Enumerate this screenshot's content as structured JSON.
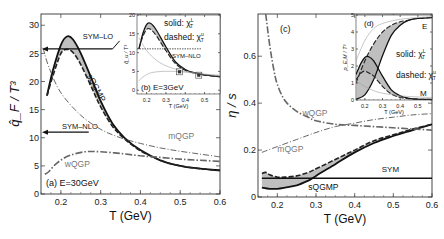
{
  "chart_data": [
    {
      "panel": "a",
      "type": "line",
      "label": "(a) E=30GeV",
      "xlabel": "T (GeV)",
      "ylabel": "q̂_F / T³",
      "xlim": [
        0.15,
        0.6
      ],
      "ylim": [
        0,
        32
      ],
      "xticks": [
        0.2,
        0.3,
        0.4,
        0.5,
        0.6
      ],
      "yticks": [
        0,
        5,
        10,
        15,
        20,
        25,
        30
      ],
      "annotations": [
        {
          "text": "SYM–LO",
          "value": 25.8,
          "arrow": "left"
        },
        {
          "text": "SYM–NLO",
          "value": 11.0,
          "arrow": "left"
        }
      ],
      "series": [
        {
          "name": "sQGMP (solid χ_T^L)",
          "style": "solid",
          "x": [
            0.165,
            0.18,
            0.2,
            0.215,
            0.23,
            0.25,
            0.28,
            0.3,
            0.33,
            0.36,
            0.4,
            0.45,
            0.5,
            0.55,
            0.6
          ],
          "y": [
            17.5,
            22,
            26.5,
            28,
            27.5,
            25,
            20,
            16.5,
            12.5,
            10,
            7.8,
            6.0,
            5.0,
            4.5,
            4.2
          ]
        },
        {
          "name": "sQGMP (dashed χ_T^u)",
          "style": "dashed",
          "x": [
            0.165,
            0.18,
            0.2,
            0.215,
            0.23,
            0.25,
            0.28,
            0.3,
            0.33,
            0.36,
            0.4,
            0.45,
            0.5,
            0.55,
            0.6
          ],
          "y": [
            17.5,
            21,
            25,
            25.7,
            25.2,
            23,
            18.5,
            15.5,
            12,
            9.8,
            7.7,
            6.0,
            5.0,
            4.5,
            4.2
          ]
        },
        {
          "name": "mQGP",
          "style": "dashdot-thin",
          "x": [
            0.155,
            0.17,
            0.2,
            0.25,
            0.3,
            0.35,
            0.4,
            0.45,
            0.5,
            0.55,
            0.6
          ],
          "y": [
            26,
            22.5,
            18,
            14,
            11.5,
            10,
            9,
            8.2,
            7.6,
            7.1,
            6.6
          ]
        },
        {
          "name": "wQGP",
          "style": "dashdot-thick",
          "x": [
            0.16,
            0.17,
            0.19,
            0.22,
            0.26,
            0.3,
            0.35,
            0.4,
            0.45,
            0.5,
            0.55,
            0.6
          ],
          "y": [
            3.5,
            4,
            5.5,
            6.8,
            7.5,
            7.5,
            7.2,
            6.8,
            6.5,
            6.2,
            6.0,
            5.8
          ]
        }
      ],
      "series_labels": [
        "sQGMP",
        "mQGP",
        "wQGP"
      ]
    },
    {
      "panel": "b",
      "type": "line",
      "label": "(b) E=3GeV",
      "inset_of": "a",
      "xlabel": "T (GeV)",
      "ylabel": "q̂_u / T³",
      "xlim": [
        0.15,
        0.58
      ],
      "ylim": [
        -1,
        20
      ],
      "xticks": [
        0.2,
        0.3,
        0.4,
        0.5
      ],
      "yticks": [
        0,
        5,
        10,
        15,
        20
      ],
      "legend": [
        "solid: χ_T^L",
        "dashed: χ_T^u"
      ],
      "annotations": [
        {
          "text": "SYM–NLO",
          "value": 11.0,
          "style": "dotted"
        }
      ],
      "series": [
        {
          "name": "solid",
          "style": "solid",
          "x": [
            0.16,
            0.18,
            0.2,
            0.22,
            0.25,
            0.3,
            0.35,
            0.4,
            0.45,
            0.5,
            0.58
          ],
          "y": [
            11,
            15,
            17.5,
            17.8,
            16,
            11.5,
            7.5,
            5.5,
            4.6,
            4.1,
            3.6
          ]
        },
        {
          "name": "dashed",
          "style": "dashed",
          "x": [
            0.16,
            0.18,
            0.2,
            0.22,
            0.25,
            0.3,
            0.35,
            0.4,
            0.45,
            0.5,
            0.58
          ],
          "y": [
            11,
            14.2,
            16.2,
            16.2,
            14.5,
            10.5,
            7.0,
            5.3,
            4.5,
            4.0,
            3.6
          ]
        },
        {
          "name": "mQGP",
          "style": "thin-gray",
          "x": [
            0.16,
            0.2,
            0.25,
            0.3,
            0.35,
            0.4,
            0.5,
            0.58
          ],
          "y": [
            14,
            10.5,
            8,
            6.5,
            5.6,
            5,
            4.3,
            4
          ]
        },
        {
          "name": "wQGP",
          "style": "thin-gray",
          "x": [
            0.16,
            0.18,
            0.22,
            0.28,
            0.35,
            0.4,
            0.5,
            0.58
          ],
          "y": [
            2.5,
            3.5,
            4.6,
            5.0,
            5.0,
            4.8,
            4.2,
            3.8
          ]
        }
      ],
      "data_points": [
        {
          "x": 0.37,
          "y": 4.9
        },
        {
          "x": 0.47,
          "y": 4.0
        }
      ]
    },
    {
      "panel": "c",
      "type": "line",
      "label": "(c)",
      "xlabel": "T (GeV)",
      "ylabel": "η / s",
      "xlim": [
        0.15,
        0.6
      ],
      "ylim": [
        0,
        0.78
      ],
      "xticks": [
        0.2,
        0.3,
        0.4,
        0.5,
        0.6
      ],
      "yticks": [
        0,
        0.2,
        0.4,
        0.6
      ],
      "annotations": [
        {
          "text": "SYM",
          "value": 0.08
        }
      ],
      "series": [
        {
          "name": "sQGMP (solid)",
          "style": "solid",
          "x": [
            0.16,
            0.18,
            0.2,
            0.22,
            0.25,
            0.28,
            0.3,
            0.35,
            0.4,
            0.45,
            0.5,
            0.55,
            0.6
          ],
          "y": [
            0.04,
            0.035,
            0.035,
            0.04,
            0.05,
            0.07,
            0.09,
            0.14,
            0.19,
            0.23,
            0.26,
            0.285,
            0.31
          ]
        },
        {
          "name": "sQGMP (dashed)",
          "style": "dashed",
          "x": [
            0.16,
            0.17,
            0.18,
            0.2,
            0.22,
            0.25,
            0.28,
            0.3,
            0.35,
            0.4,
            0.45,
            0.5,
            0.55,
            0.6
          ],
          "y": [
            0.1,
            0.105,
            0.095,
            0.085,
            0.085,
            0.09,
            0.105,
            0.12,
            0.16,
            0.2,
            0.24,
            0.265,
            0.29,
            0.31
          ]
        },
        {
          "name": "SYM",
          "style": "solid-flat",
          "x": [
            0.16,
            0.6
          ],
          "y": [
            0.08,
            0.08
          ]
        },
        {
          "name": "mQGP",
          "style": "dashdot-thin",
          "x": [
            0.16,
            0.2,
            0.25,
            0.3,
            0.35,
            0.4,
            0.45,
            0.5,
            0.55,
            0.6
          ],
          "y": [
            0.19,
            0.215,
            0.245,
            0.275,
            0.3,
            0.315,
            0.33,
            0.34,
            0.35,
            0.355
          ]
        },
        {
          "name": "wQGP",
          "style": "dashdot-thick",
          "x": [
            0.17,
            0.18,
            0.19,
            0.2,
            0.22,
            0.25,
            0.28,
            0.3,
            0.35,
            0.4,
            0.45,
            0.5,
            0.55,
            0.6
          ],
          "y": [
            0.78,
            0.65,
            0.55,
            0.48,
            0.41,
            0.365,
            0.34,
            0.325,
            0.31,
            0.305,
            0.3,
            0.295,
            0.29,
            0.285
          ]
        }
      ],
      "series_labels": [
        "sQGMP",
        "mQGP",
        "wQGP",
        "SYM"
      ]
    },
    {
      "panel": "d",
      "type": "line",
      "label": "(d)",
      "inset_of": "c",
      "xlabel": "T (GeV)",
      "ylabel": "ρ_E,M / T³",
      "xlim": [
        0.15,
        0.58
      ],
      "ylim": [
        0,
        5
      ],
      "xticks": [
        0.2,
        0.3,
        0.4,
        0.5
      ],
      "yticks": [
        0,
        1,
        2,
        3,
        4,
        5
      ],
      "legend": [
        "solid: χ_T^L",
        "dashed: χ_T^u"
      ],
      "series_labels": [
        "E",
        "M"
      ],
      "series": [
        {
          "name": "E solid",
          "style": "solid",
          "x": [
            0.15,
            0.2,
            0.25,
            0.3,
            0.35,
            0.4,
            0.45,
            0.5,
            0.58
          ],
          "y": [
            0.05,
            0.3,
            1.2,
            2.6,
            3.8,
            4.4,
            4.7,
            4.8,
            4.85
          ]
        },
        {
          "name": "E dashed",
          "style": "dashed",
          "x": [
            0.15,
            0.2,
            0.25,
            0.3,
            0.35,
            0.4,
            0.45,
            0.5,
            0.58
          ],
          "y": [
            1.0,
            2.3,
            3.3,
            4.0,
            4.4,
            4.6,
            4.7,
            4.8,
            4.85
          ]
        },
        {
          "name": "M solid",
          "style": "solid",
          "x": [
            0.15,
            0.18,
            0.2,
            0.22,
            0.25,
            0.3,
            0.35,
            0.4,
            0.45,
            0.5,
            0.58
          ],
          "y": [
            1.5,
            2.2,
            2.5,
            2.55,
            2.3,
            1.4,
            0.6,
            0.25,
            0.1,
            0.05,
            0.03
          ]
        },
        {
          "name": "M dashed",
          "style": "dashed",
          "x": [
            0.15,
            0.18,
            0.2,
            0.22,
            0.25,
            0.3,
            0.35,
            0.4,
            0.45,
            0.5,
            0.58
          ],
          "y": [
            1.2,
            1.6,
            1.7,
            1.6,
            1.4,
            0.8,
            0.35,
            0.15,
            0.08,
            0.05,
            0.03
          ]
        },
        {
          "name": "E mQGP",
          "style": "thin-gray",
          "x": [
            0.15,
            0.2,
            0.25,
            0.3,
            0.4,
            0.5,
            0.58
          ],
          "y": [
            2.3,
            3.5,
            4.2,
            4.5,
            4.75,
            4.85,
            4.9
          ]
        },
        {
          "name": "M mQGP",
          "style": "thin-gray",
          "x": [
            0.15,
            0.2,
            0.25,
            0.3,
            0.4,
            0.5,
            0.58
          ],
          "y": [
            1.1,
            0.8,
            0.55,
            0.4,
            0.25,
            0.18,
            0.15
          ]
        }
      ]
    }
  ]
}
